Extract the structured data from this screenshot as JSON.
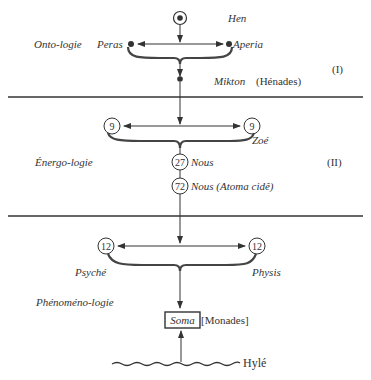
{
  "diagram": {
    "colors": {
      "ink": "#333333",
      "brace": "#444444",
      "background": "#ffffff"
    },
    "section_1": {
      "roman": "(I)",
      "domain_label": "Onto-logie",
      "top_node": {
        "label": "Hen",
        "icon": "circled-dot"
      },
      "left_node": {
        "label": "Peras",
        "icon": "dot"
      },
      "right_node": {
        "label": "Aperia",
        "icon": "dot"
      },
      "result_node": {
        "label": "Mikton",
        "suffix": "(Hénades)",
        "icon": "dot"
      }
    },
    "section_2": {
      "roman": "(II)",
      "domain_label": "Énergo-logie",
      "left_node": {
        "value": "9"
      },
      "right_node": {
        "value": "9",
        "label": "Zoé"
      },
      "node_27": {
        "value": "27",
        "label": "Nous"
      },
      "node_72": {
        "value": "72",
        "label": "Nous (Atoma cidê)"
      }
    },
    "section_3": {
      "domain_label": "Phénoméno-logie",
      "left_node": {
        "value": "12",
        "label": "Psyché"
      },
      "right_node": {
        "value": "12",
        "label": "Physis"
      },
      "soma_box": {
        "label": "Soma",
        "suffix": "[Monades]"
      },
      "base": {
        "label": "Hylé",
        "icon": "wavy-line"
      }
    }
  }
}
